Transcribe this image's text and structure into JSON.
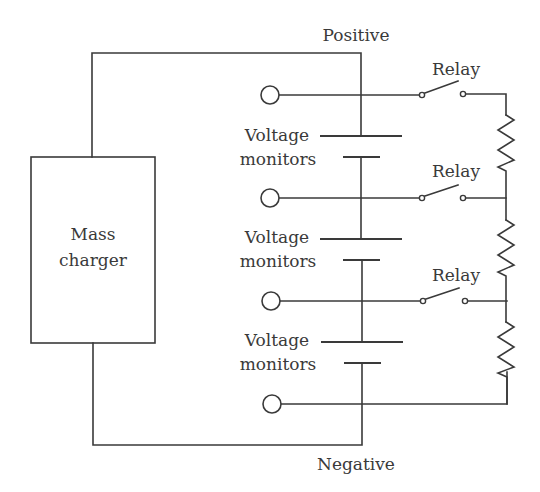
{
  "diagram": {
    "type": "circuit-schematic",
    "colors": {
      "line": "#3a3a3a",
      "background": "#ffffff"
    },
    "labels": {
      "positive": "Positive",
      "negative": "Negative",
      "charger_line1": "Mass",
      "charger_line2": "charger",
      "relay_1": "Relay",
      "relay_2": "Relay",
      "relay_3": "Relay",
      "monitor_1_line1": "Voltage",
      "monitor_1_line2": "monitors",
      "monitor_2_line1": "Voltage",
      "monitor_2_line2": "monitors",
      "monitor_3_line1": "Voltage",
      "monitor_3_line2": "monitors"
    },
    "components": {
      "charger": {
        "label": "Mass charger"
      },
      "cells": 3,
      "terminals": 4,
      "relays": 3,
      "resistors": 3
    }
  }
}
